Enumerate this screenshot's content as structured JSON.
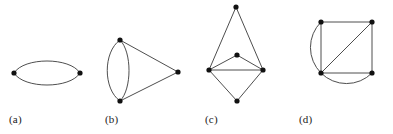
{
  "figure": {
    "background": "#ffffff",
    "stroke_color": "#3a3a3a",
    "vertex_color": "#111111",
    "stroke_width": 0.9,
    "vertex_radius": 2.6,
    "panels": [
      {
        "id": "a",
        "caption": "(a)",
        "description": "two vertices joined by a pair of parallel edges forming an ellipse",
        "vertices": [
          {
            "name": "left",
            "x": 14,
            "y": 73
          },
          {
            "name": "right",
            "x": 80,
            "y": 73
          }
        ],
        "edges": [
          {
            "type": "arc",
            "from": "left",
            "to": "right",
            "bulge": -16
          },
          {
            "type": "arc",
            "from": "left",
            "to": "right",
            "bulge": 16
          }
        ]
      },
      {
        "id": "b",
        "caption": "(b)",
        "description": "two vertices joined by a pair of parallel edges plus a triangle to a third vertex",
        "vertices": [
          {
            "name": "top",
            "x": 120,
            "y": 40
          },
          {
            "name": "bottom",
            "x": 120,
            "y": 101
          },
          {
            "name": "right",
            "x": 178,
            "y": 72
          }
        ],
        "edges": [
          {
            "type": "arc",
            "from": "top",
            "to": "bottom",
            "bulge": -18
          },
          {
            "type": "arc",
            "from": "top",
            "to": "bottom",
            "bulge": 10
          },
          {
            "type": "line",
            "from": "top",
            "to": "right"
          },
          {
            "type": "line",
            "from": "bottom",
            "to": "right"
          }
        ]
      },
      {
        "id": "c",
        "caption": "(c)",
        "description": "five vertices: left and right joined by a straight edge, with a top vertex, a centre vertex and a bottom vertex each joined to both",
        "vertices": [
          {
            "name": "top",
            "x": 236,
            "y": 7
          },
          {
            "name": "centre",
            "x": 237,
            "y": 55
          },
          {
            "name": "left",
            "x": 209,
            "y": 70
          },
          {
            "name": "right",
            "x": 263,
            "y": 70
          },
          {
            "name": "bottom",
            "x": 237,
            "y": 101
          }
        ],
        "edges": [
          {
            "type": "line",
            "from": "top",
            "to": "left"
          },
          {
            "type": "line",
            "from": "top",
            "to": "right"
          },
          {
            "type": "line",
            "from": "centre",
            "to": "left"
          },
          {
            "type": "line",
            "from": "centre",
            "to": "right"
          },
          {
            "type": "line",
            "from": "left",
            "to": "right"
          },
          {
            "type": "line",
            "from": "left",
            "to": "bottom"
          },
          {
            "type": "line",
            "from": "right",
            "to": "bottom"
          }
        ]
      },
      {
        "id": "d",
        "caption": "(d)",
        "description": "a square with one diagonal plus a circular arc from the top-left vertex round to the bottom-right vertex",
        "vertices": [
          {
            "name": "top-left",
            "x": 321,
            "y": 22
          },
          {
            "name": "top-right",
            "x": 372,
            "y": 22
          },
          {
            "name": "bottom-left",
            "x": 321,
            "y": 73
          },
          {
            "name": "bottom-right",
            "x": 372,
            "y": 73
          }
        ],
        "edges": [
          {
            "type": "line",
            "from": "top-left",
            "to": "top-right"
          },
          {
            "type": "line",
            "from": "top-right",
            "to": "bottom-right"
          },
          {
            "type": "line",
            "from": "bottom-right",
            "to": "bottom-left"
          },
          {
            "type": "line",
            "from": "bottom-left",
            "to": "top-left"
          },
          {
            "type": "line",
            "from": "top-right",
            "to": "bottom-left"
          },
          {
            "type": "arc",
            "from": "top-left",
            "to": "bottom-right",
            "sweep": "counter-clockwise",
            "radius": 36
          }
        ]
      }
    ]
  }
}
